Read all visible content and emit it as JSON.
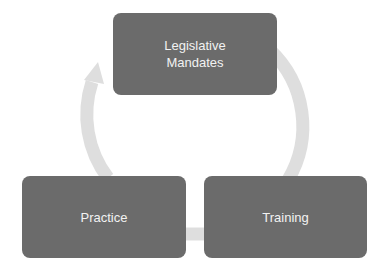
{
  "diagram": {
    "type": "cycle",
    "nodes": [
      {
        "label": "Legislative\nMandates",
        "line1": "Legislative",
        "line2": "Mandates"
      },
      {
        "label": "Training"
      },
      {
        "label": "Practice"
      }
    ],
    "edges": [
      {
        "from": "Legislative Mandates",
        "to": "Training"
      },
      {
        "from": "Training",
        "to": "Practice"
      },
      {
        "from": "Practice",
        "to": "Legislative Mandates"
      }
    ],
    "colors": {
      "node_fill": "#6b6b6b",
      "node_text": "#f2f2f2",
      "arrow": "#dedede"
    }
  }
}
